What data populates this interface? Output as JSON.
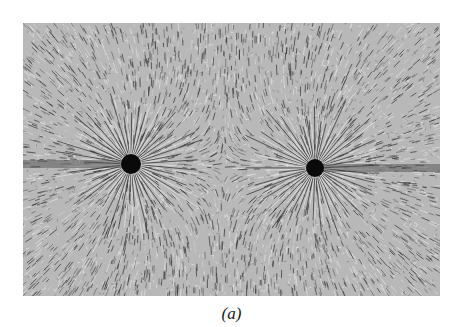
{
  "figure": {
    "caption": "(a)",
    "charges": [
      {
        "label": "left-charge",
        "cx": 108,
        "cy": 141,
        "r": 10
      },
      {
        "label": "right-charge",
        "cx": 292,
        "cy": 145,
        "r": 9
      }
    ],
    "colors": {
      "background": "#b8b8b8",
      "line": "#3a3a3a",
      "light": "#e0e0e0",
      "charge": "#0a0a0a"
    }
  }
}
